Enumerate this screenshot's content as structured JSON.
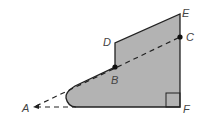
{
  "diagram": {
    "labels": {
      "A": "A",
      "B": "B",
      "C": "C",
      "D": "D",
      "E": "E",
      "F": "F"
    },
    "colors": {
      "fill": "#b3b3b3",
      "stroke": "#222222",
      "label": "#444444"
    },
    "right_angle_at": "F"
  }
}
